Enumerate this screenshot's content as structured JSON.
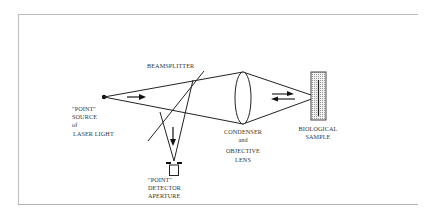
{
  "diagram": {
    "colors": {
      "frame": "#b8b8b8",
      "line": "#222222",
      "text": "#333333",
      "sample_fill": "#d8d8d8"
    },
    "labels": {
      "beamsplitter": "BEAMSPLITTER",
      "source": [
        "\"POINT\"",
        "SOURCE",
        "of",
        "LASER LIGHT"
      ],
      "lens": [
        "CONDENSER",
        "and",
        "OBJECTIVE",
        "LENS"
      ],
      "sample": [
        "BIOLOGICAL",
        "SAMPLE"
      ],
      "detector": [
        "\"POINT\"",
        "DETECTOR",
        "APERTURE"
      ]
    },
    "icons": {
      "source_dot": "point-source",
      "arrow_right": "beam-direction-right",
      "arrow_down": "beam-direction-down",
      "arrow_bidirectional": "beam-direction-both"
    }
  }
}
